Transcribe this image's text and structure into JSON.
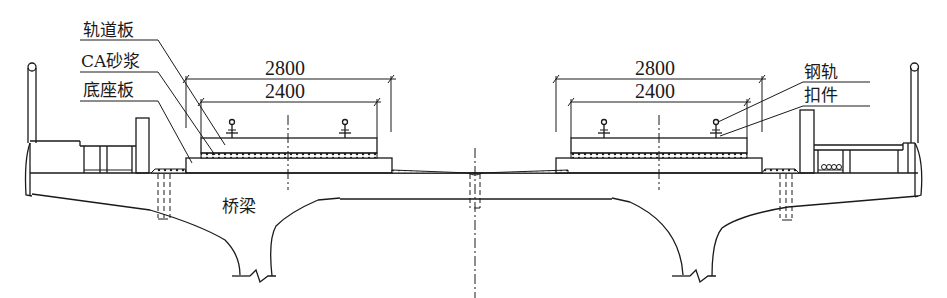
{
  "diagram": {
    "type": "bridge-cross-section",
    "labels": {
      "track_slab": "轨道板",
      "ca_mortar": "CA砂浆",
      "base_plate": "底座板",
      "bridge_girder": "桥梁",
      "rail": "钢轨",
      "fastener": "扣件"
    },
    "dimensions": {
      "left_outer": "2800",
      "left_inner": "2400",
      "right_outer": "2800",
      "right_inner": "2400"
    },
    "colors": {
      "line": "#1a1a1a",
      "background": "#ffffff"
    }
  }
}
